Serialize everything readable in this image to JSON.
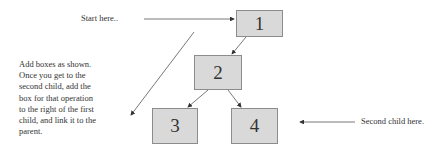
{
  "diagram": {
    "nodes": [
      {
        "id": "1",
        "label": "1"
      },
      {
        "id": "2",
        "label": "2"
      },
      {
        "id": "3",
        "label": "3"
      },
      {
        "id": "4",
        "label": "4"
      }
    ],
    "edges": [
      {
        "from": "1",
        "to": "2"
      },
      {
        "from": "2",
        "to": "3"
      },
      {
        "from": "2",
        "to": "4"
      }
    ],
    "annotations": {
      "start": "Start here..",
      "instructions": "Add boxes as shown. Once you get to the second child, add the box for that operation to the right of the first child, and link it to the parent.",
      "second_child": "Second child here."
    },
    "colors": {
      "node_fill": "#d9d9d9",
      "node_border": "#8c8c8c",
      "line": "#555555"
    }
  }
}
